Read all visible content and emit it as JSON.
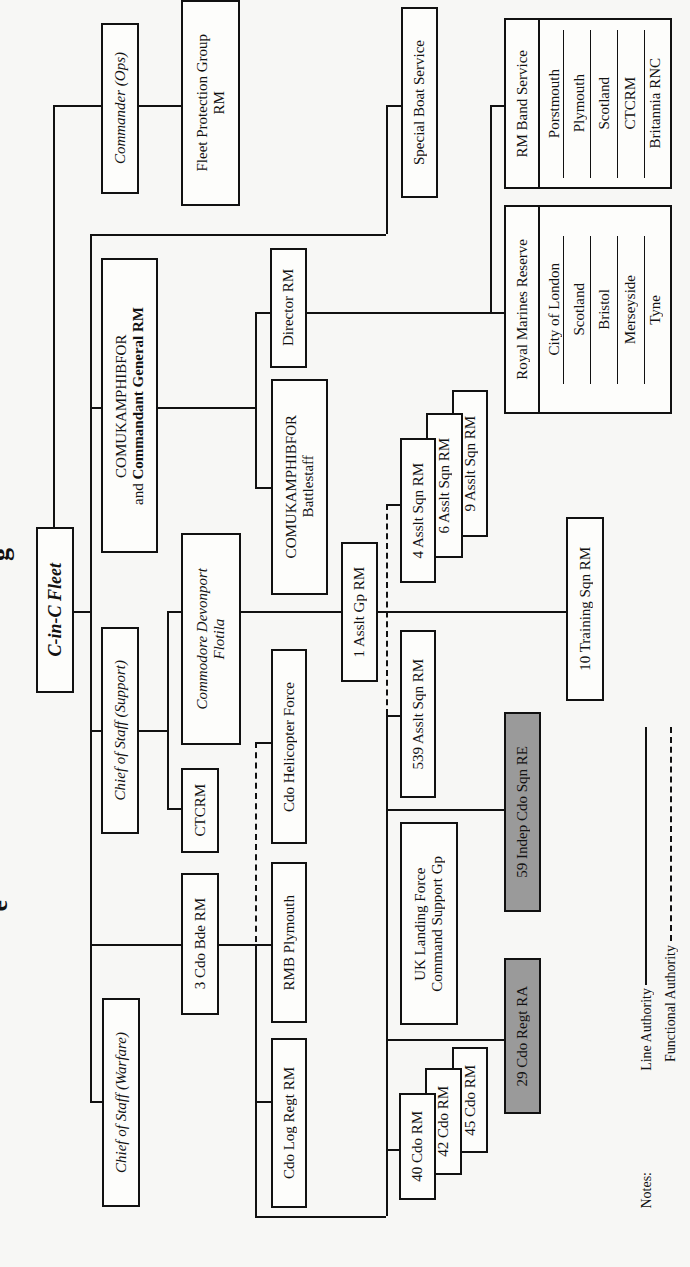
{
  "title_fragments": {
    "top": "g",
    "bottom": "e"
  },
  "nodes": {
    "cinc": "C-in-C Fleet",
    "commander_ops": "Commander (Ops)",
    "fleet_protection": {
      "line1": "Fleet Protection Group",
      "line2": "RM"
    },
    "special_boat": "Special Boat Service",
    "comuk_cg": {
      "line1": "COMUKAMPHIBFOR",
      "line2_prefix": "and ",
      "line2_bold": "Commandant General RM"
    },
    "director_rm": "Director RM",
    "battlestaff": {
      "line1": "COMUKAMPHIBFOR",
      "line2": "Battlestaff"
    },
    "cos_support": "Chief of Staff (Support)",
    "commodore": {
      "line1": "Commodore Devonport",
      "line2": "Flotila"
    },
    "ctcrm": "CTCRM",
    "heli": "Cdo Helicopter Force",
    "asslt_gp": "1 Asslt Gp RM",
    "asslt_4": "4 Asslt Sqn RM",
    "asslt_6": "6 Asslt Sqn RM",
    "asslt_9": "9 Asslt Sqn RM",
    "asslt_539": "539 Asslt Sqn RM",
    "training_10": "10 Training Sqn RM",
    "indep_59": "59 Indep Cdo Sqn RE",
    "ukl": {
      "line1": "UK Landing Force",
      "line2": "Command Support Gp"
    },
    "bde_3": "3 Cdo Bde RM",
    "rmb_plymouth": "RMB Plymouth",
    "cos_warfare": "Chief of Staff (Warfare)",
    "log_regt": "Cdo Log Regt RM",
    "cdo_40": "40 Cdo RM",
    "cdo_42": "42 Cdo RM",
    "cdo_45": "45 Cdo RM",
    "regt_29": "29 Cdo Regt RA"
  },
  "rm_reserve": {
    "title": "Royal Marines Reserve",
    "units": [
      "City of London",
      "Scotland",
      "Bristol",
      "Merseyside",
      "Tyne"
    ]
  },
  "rm_band": {
    "title": "RM Band Service",
    "units": [
      "Porstmouth",
      "Plymouth",
      "Scotland",
      "CTCRM",
      "Britannia RNC"
    ]
  },
  "notes": {
    "label": "Notes:",
    "line_authority": "Line Authority",
    "functional_authority": "Functional Authority"
  },
  "colors": {
    "line": "#111111",
    "shaded_box": "#9a9a9a",
    "background": "#f7f7f5"
  }
}
